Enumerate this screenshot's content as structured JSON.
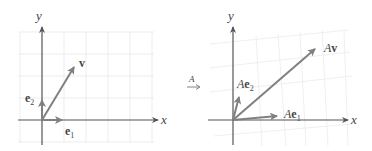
{
  "left_panel": {
    "x_axis_label": "x",
    "y_axis_label": "y",
    "vectors": [
      {
        "name": "e1",
        "label_main": "e",
        "label_sub": "1"
      },
      {
        "name": "e2",
        "label_main": "e",
        "label_sub": "2"
      },
      {
        "name": "v",
        "label_main": "v",
        "label_sub": ""
      }
    ]
  },
  "transform_arrow": {
    "label": "A"
  },
  "right_panel": {
    "x_axis_label": "x",
    "y_axis_label": "y",
    "vectors": [
      {
        "name": "Ae1",
        "label_prefix": "A",
        "label_main": "e",
        "label_sub": "1"
      },
      {
        "name": "Ae2",
        "label_prefix": "A",
        "label_main": "e",
        "label_sub": "2"
      },
      {
        "name": "Av",
        "label_prefix": "A",
        "label_main": "v",
        "label_sub": ""
      }
    ]
  },
  "colors": {
    "axis": "#555555",
    "vector": "#808080",
    "grid": "#e6e6e6",
    "text": "#444444"
  }
}
